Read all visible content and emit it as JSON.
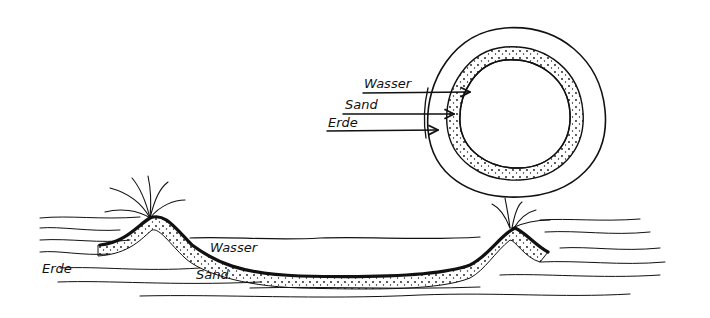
{
  "diagram": {
    "type": "hand-drawn cross-section",
    "top_view": {
      "labels": [
        {
          "text": "Wasser",
          "points_to": "inner water area"
        },
        {
          "text": "Sand",
          "points_to": "dotted sand ring"
        },
        {
          "text": "Erde",
          "points_to": "outer earth ring"
        }
      ]
    },
    "cross_section": {
      "labels": [
        {
          "text": "Wasser"
        },
        {
          "text": "Sand"
        },
        {
          "text": "Erde"
        }
      ]
    }
  }
}
